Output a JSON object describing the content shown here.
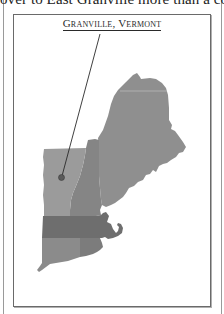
{
  "page": {
    "top_text_fragment": "over to East Granville more than a cou"
  },
  "map": {
    "title": "Granville, Vermont",
    "marker_label": "Granville, Vermont location marker",
    "states": [
      "Maine",
      "New Hampshire",
      "Vermont",
      "Massachusetts",
      "Connecticut",
      "Rhode Island"
    ],
    "colors": {
      "maine": "#8f8f8f",
      "new_hampshire": "#858585",
      "vermont": "#9b9b9b",
      "massachusetts": "#6e6e6e",
      "connecticut": "#8b8b8b",
      "rhode_island": "#7c7c7c",
      "marker": "#5a5a5a",
      "leader_line": "#2a2a2a",
      "frame": "#6a6a6a"
    }
  }
}
